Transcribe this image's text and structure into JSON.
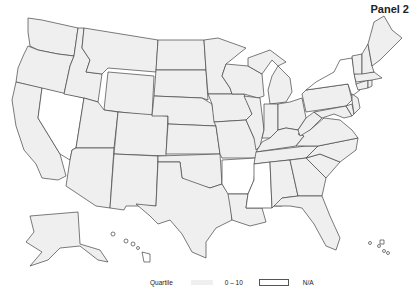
{
  "panel": {
    "title": "Panel 2"
  },
  "legend": {
    "title": "Quartile",
    "items": [
      {
        "label": "0 – 10",
        "color": "#efefef"
      },
      {
        "label": "N/A",
        "color": "#ffffff"
      }
    ]
  },
  "colors": {
    "range_0_10": "#efefef",
    "na": "#ffffff",
    "border": "#444444"
  },
  "states": {
    "Washington": "0-10",
    "Oregon": "0-10",
    "California": "0-10",
    "Nevada": "N/A",
    "Idaho": "0-10",
    "Montana": "0-10",
    "Wyoming": "0-10",
    "Utah": "0-10",
    "Arizona": "0-10",
    "Colorado": "0-10",
    "New Mexico": "0-10",
    "North Dakota": "0-10",
    "South Dakota": "0-10",
    "Nebraska": "0-10",
    "Kansas": "0-10",
    "Oklahoma": "0-10",
    "Texas": "0-10",
    "Minnesota": "0-10",
    "Iowa": "0-10",
    "Missouri": "0-10",
    "Arkansas": "N/A",
    "Louisiana": "0-10",
    "Wisconsin": "0-10",
    "Illinois": "0-10",
    "Michigan": "0-10",
    "Indiana": "0-10",
    "Ohio": "0-10",
    "Kentucky": "0-10",
    "Tennessee": "0-10",
    "Mississippi": "N/A",
    "Alabama": "0-10",
    "Georgia": "0-10",
    "Florida": "0-10",
    "South Carolina": "0-10",
    "North Carolina": "0-10",
    "Virginia": "0-10",
    "West Virginia": "0-10",
    "Pennsylvania": "0-10",
    "New York": "N/A",
    "Maryland": "0-10",
    "Delaware": "0-10",
    "New Jersey": "0-10",
    "Connecticut": "0-10",
    "Rhode Island": "0-10",
    "Massachusetts": "0-10",
    "Vermont": "0-10",
    "New Hampshire": "0-10",
    "Maine": "0-10",
    "Alaska": "0-10",
    "Hawaii": "N/A",
    "Puerto Rico": "N/A"
  }
}
